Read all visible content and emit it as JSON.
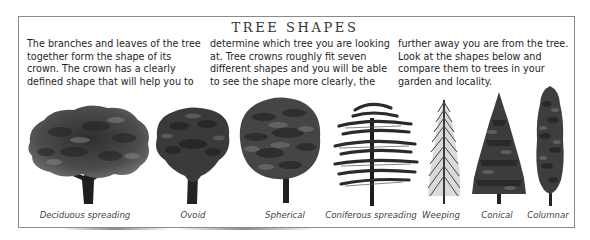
{
  "title": "TREE SHAPES",
  "intro": {
    "columns": [
      {
        "lines": [
          "The branches and leaves of the tree",
          "together form the shape of its",
          "crown. The crown has a clearly",
          "defined shape that will help you to"
        ]
      },
      {
        "lines": [
          "determine which tree you are looking",
          "at. Tree crowns roughly fit seven",
          "different shapes and you will be able",
          "to see the shape more clearly, the"
        ]
      },
      {
        "lines": [
          "further away you are from the tree.",
          "Look at the shapes below and",
          "compare them to trees in your",
          "garden and locality."
        ]
      }
    ]
  },
  "trees": [
    {
      "label": "Deciduous spreading",
      "icon": "deciduous-spreading-tree-icon"
    },
    {
      "label": "Ovoid",
      "icon": "ovoid-tree-icon"
    },
    {
      "label": "Spherical",
      "icon": "spherical-tree-icon"
    },
    {
      "label": "Coniferous spreading",
      "icon": "coniferous-spreading-tree-icon"
    },
    {
      "label": "Weeping",
      "icon": "weeping-tree-icon"
    },
    {
      "label": "Conical",
      "icon": "conical-tree-icon"
    },
    {
      "label": "Columnar",
      "icon": "columnar-tree-icon"
    }
  ],
  "colors": {
    "foliage_dark": "#2b2b2b",
    "foliage_mid": "#555555",
    "foliage_light": "#7a7a7a",
    "border": "#8a8a8a"
  }
}
